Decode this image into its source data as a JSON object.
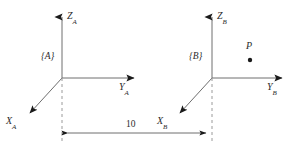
{
  "figure": {
    "title": "",
    "background_color": "#ffffff",
    "line_color": "#6e6e6e",
    "arrow_color": "#1a1a1a",
    "text_color": "#2b2b2b",
    "dash_color": "#9a9a9a"
  },
  "frames": [
    {
      "id": "A",
      "frame_label": "{A}",
      "origin": {
        "x": 62,
        "y": 78
      },
      "axes": [
        {
          "name": "Z",
          "label_base": "Z",
          "label_sub": "A",
          "tip": {
            "x": 62,
            "y": 12
          }
        },
        {
          "name": "Y",
          "label_base": "Y",
          "label_sub": "A",
          "tip": {
            "x": 140,
            "y": 78
          }
        },
        {
          "name": "X",
          "label_base": "X",
          "label_sub": "A",
          "tip": {
            "x": 25,
            "y": 118
          }
        }
      ]
    },
    {
      "id": "B",
      "frame_label": "{B}",
      "origin": {
        "x": 212,
        "y": 78
      },
      "axes": [
        {
          "name": "Z",
          "label_base": "Z",
          "label_sub": "B",
          "tip": {
            "x": 212,
            "y": 12
          }
        },
        {
          "name": "Y",
          "label_base": "Y",
          "label_sub": "B",
          "tip": {
            "x": 288,
            "y": 78
          }
        },
        {
          "name": "X",
          "label_base": "X",
          "label_sub": "B",
          "tip": {
            "x": 175,
            "y": 118
          }
        }
      ]
    }
  ],
  "dimension": {
    "value": "10",
    "from_x": 62,
    "to_x": 212,
    "y": 133
  },
  "point": {
    "label": "P",
    "x": 250,
    "y": 60
  }
}
